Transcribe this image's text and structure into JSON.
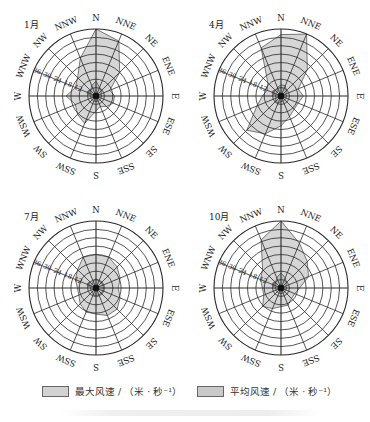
{
  "chart_data": [
    {
      "type": "radar",
      "title": "1月",
      "directions": [
        "N",
        "NNE",
        "NE",
        "ENE",
        "E",
        "ESE",
        "SE",
        "SSE",
        "S",
        "SSW",
        "SW",
        "WSW",
        "W",
        "WNW",
        "NW",
        "NNW"
      ],
      "radial_ticks": [
        6,
        12,
        18,
        24,
        30,
        36
      ],
      "rlim": [
        0,
        36
      ],
      "series": [
        {
          "name": "最大风速 / (米·秒⁻¹)",
          "values": [
            36,
            32,
            18,
            8,
            10,
            10,
            8,
            6,
            8,
            16,
            14,
            12,
            16,
            12,
            14,
            22
          ]
        },
        {
          "name": "平均风速 / (米·秒⁻¹)",
          "values": [
            8,
            5,
            4,
            3,
            3,
            3,
            3,
            3,
            3,
            3,
            3,
            3,
            3,
            3,
            4,
            6
          ]
        }
      ]
    },
    {
      "type": "radar",
      "title": "4月",
      "directions": [
        "N",
        "NNE",
        "NE",
        "ENE",
        "E",
        "ESE",
        "SE",
        "SSE",
        "S",
        "SSW",
        "SW",
        "WSW",
        "W",
        "WNW",
        "NW",
        "NNW"
      ],
      "radial_ticks": [
        6,
        12,
        18,
        24,
        30,
        36
      ],
      "rlim": [
        0,
        36
      ],
      "series": [
        {
          "name": "最大风速 / (米·秒⁻¹)",
          "values": [
            33,
            36,
            20,
            10,
            12,
            10,
            10,
            12,
            16,
            22,
            26,
            14,
            10,
            8,
            10,
            28
          ]
        },
        {
          "name": "平均风速 / (米·秒⁻¹)",
          "values": [
            6,
            6,
            4,
            3,
            3,
            3,
            3,
            3,
            3,
            4,
            4,
            3,
            3,
            3,
            3,
            5
          ]
        }
      ]
    },
    {
      "type": "radar",
      "title": "7月",
      "directions": [
        "N",
        "NNE",
        "NE",
        "ENE",
        "E",
        "ESE",
        "SE",
        "SSE",
        "S",
        "SSW",
        "SW",
        "WSW",
        "W",
        "WNW",
        "NW",
        "NNW"
      ],
      "radial_ticks": [
        6,
        12,
        18,
        24,
        30,
        36
      ],
      "rlim": [
        0,
        36
      ],
      "series": [
        {
          "name": "最大风速 / (米·秒⁻¹)",
          "values": [
            18,
            18,
            16,
            14,
            12,
            14,
            16,
            16,
            14,
            14,
            12,
            10,
            10,
            12,
            14,
            18
          ]
        },
        {
          "name": "平均风速 / (米·秒⁻¹)",
          "values": [
            5,
            4,
            4,
            4,
            4,
            4,
            4,
            4,
            4,
            4,
            3,
            3,
            3,
            3,
            3,
            4
          ]
        }
      ]
    },
    {
      "type": "radar",
      "title": "10月",
      "directions": [
        "N",
        "NNE",
        "NE",
        "ENE",
        "E",
        "ESE",
        "SE",
        "SSE",
        "S",
        "SSW",
        "SW",
        "WSW",
        "W",
        "WNW",
        "NW",
        "NNW"
      ],
      "radial_ticks": [
        6,
        12,
        18,
        24,
        30,
        36
      ],
      "rlim": [
        0,
        36
      ],
      "series": [
        {
          "name": "最大风速 / (米·秒⁻¹)",
          "values": [
            36,
            26,
            20,
            16,
            10,
            8,
            8,
            10,
            10,
            12,
            14,
            10,
            10,
            12,
            14,
            28
          ]
        },
        {
          "name": "平均风速 / (米·秒⁻¹)",
          "values": [
            8,
            6,
            4,
            3,
            3,
            3,
            3,
            3,
            3,
            3,
            3,
            3,
            3,
            3,
            4,
            6
          ]
        }
      ]
    }
  ],
  "panels": [
    {
      "label": "1月"
    },
    {
      "label": "4月"
    },
    {
      "label": "7月"
    },
    {
      "label": "10月"
    }
  ],
  "legend": {
    "max_label": "最大风速 / （米 · 秒⁻¹）",
    "avg_label": "平均风速 / （米 · 秒⁻¹）"
  },
  "colors": {
    "grid": "#2a2a2a",
    "max_fill": "#d6d6d6",
    "avg_fill": "#bdbdbd",
    "background": "#ffffff"
  }
}
